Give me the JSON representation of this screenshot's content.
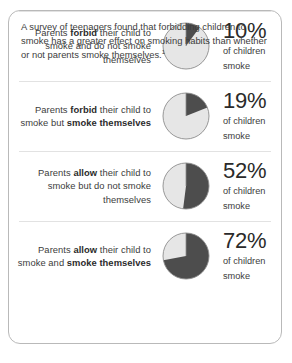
{
  "chart_data": {
    "type": "pie",
    "unit": "%",
    "slice_labels": [
      "children who smoke",
      "children who do not smoke"
    ],
    "colors": {
      "smoke": "#4d4d4d",
      "nonsmoke": "#e6e6e6",
      "outline": "#8c8c8c"
    },
    "categories": [
      "Parents forbid their child to smoke and do not smoke themselves",
      "Parents forbid their child to smoke but smoke themselves",
      "Parents allow their child to smoke but do not smoke themselves",
      "Parents allow their child to smoke and smoke themselves"
    ],
    "values": [
      10,
      19,
      52,
      72
    ],
    "ylabel": "of children smoke",
    "legend": "none",
    "grid": false
  },
  "rows": [
    {
      "label_html": "Parents <b>forbid</b> their child to smoke and do not smoke themselves",
      "percent": "10%",
      "percent_value": 10,
      "sub_line1": "of children",
      "sub_line2": "smoke",
      "pie_name": "pie-chart-10-percent"
    },
    {
      "label_html": "Parents <b>forbid</b> their child to smoke but <b>smoke themselves</b>",
      "percent": "19%",
      "percent_value": 19,
      "sub_line1": "of children",
      "sub_line2": "smoke",
      "pie_name": "pie-chart-19-percent"
    },
    {
      "label_html": "Parents <b>allow</b> their child to smoke but do not smoke themselves",
      "percent": "52%",
      "percent_value": 52,
      "sub_line1": "of children",
      "sub_line2": "smoke",
      "pie_name": "pie-chart-52-percent"
    },
    {
      "label_html": "Parents <b>allow</b> their child to smoke and <b>smoke themselves</b>",
      "percent": "72%",
      "percent_value": 72,
      "sub_line1": "of children",
      "sub_line2": "smoke",
      "pie_name": "pie-chart-72-percent"
    }
  ],
  "footer": {
    "text": "A survey of teenagers found that forbidding children to smoke has a greater effect on smoking habits than whether or not parents smoke themselves.",
    "footnote_marker": "1"
  }
}
